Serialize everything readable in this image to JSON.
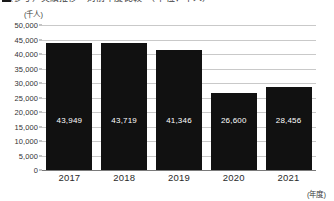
{
  "figure": {
    "title_clipped": "（参考）実績推移　対前年度比較　（単位：千人）",
    "unit_label": "(千人)",
    "x_axis_caption": "(年度)",
    "bar_color": "#111111",
    "grid_color": "#c9c9c9",
    "background_color": "#ffffff"
  },
  "chart_data": {
    "type": "bar",
    "title": "",
    "xlabel": "(年度)",
    "ylabel": "(千人)",
    "categories": [
      "2017",
      "2018",
      "2019",
      "2020",
      "2021"
    ],
    "values": [
      43949,
      43719,
      41346,
      26600,
      28456
    ],
    "value_labels": [
      "43,949",
      "43,719",
      "41,346",
      "26,600",
      "28,456"
    ],
    "ylim": [
      0,
      50000
    ],
    "yticks": [
      0,
      5000,
      10000,
      15000,
      20000,
      25000,
      30000,
      35000,
      40000,
      45000,
      50000
    ],
    "ytick_labels": [
      "0",
      "5,000",
      "10,000",
      "15,000",
      "20,000",
      "25,000",
      "30,000",
      "35,000",
      "40,000",
      "45,000",
      "50,000"
    ],
    "grid": true,
    "legend": null,
    "series": [
      {
        "name": "",
        "values": [
          43949,
          43719,
          41346,
          26600,
          28456
        ]
      }
    ]
  }
}
